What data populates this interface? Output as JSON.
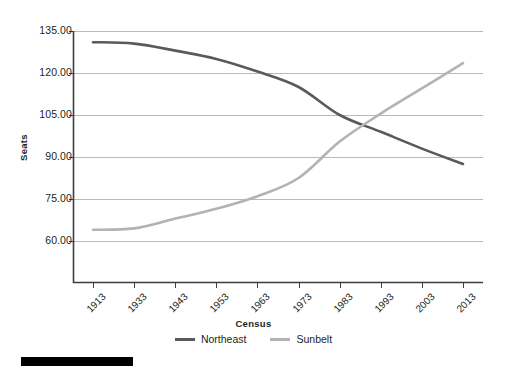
{
  "chart_data": {
    "type": "line",
    "title": "",
    "xlabel": "Census",
    "ylabel": "Seats",
    "grid": true,
    "legend_position": "bottom",
    "categories": [
      "1913",
      "1933",
      "1943",
      "1953",
      "1963",
      "1973",
      "1983",
      "1993",
      "2003",
      "2013"
    ],
    "ylim": [
      45.0,
      135.0
    ],
    "yticks": [
      "60.00",
      "75.00",
      "90.00",
      "105.00",
      "120.00",
      "135.00"
    ],
    "ytick_values": [
      60,
      75,
      90,
      105,
      120,
      135
    ],
    "series": [
      {
        "name": "Northeast",
        "color": "#5a5a5a",
        "values": [
          131.0,
          130.5,
          128.0,
          125.0,
          120.5,
          115.0,
          105.0,
          99.0,
          93.0,
          87.5
        ]
      },
      {
        "name": "Sunbelt",
        "color": "#b3b3b3",
        "values": [
          64.0,
          64.5,
          68.0,
          71.5,
          76.0,
          82.5,
          95.5,
          105.5,
          114.5,
          123.5
        ]
      }
    ]
  },
  "axes": {
    "y_title": "Seats",
    "x_title": "Census"
  },
  "legend": {
    "entries": [
      {
        "label": "Northeast",
        "color": "#5a5a5a",
        "swatch": "line-swatch"
      },
      {
        "label": "Sunbelt",
        "color": "#b3b3b3",
        "swatch": "line-swatch"
      }
    ]
  },
  "colors": {
    "northeast": "#5a5a5a",
    "sunbelt": "#b3b3b3",
    "gridline": "#b9b9b9",
    "axis": "#3d3d3d",
    "text": "#231f20",
    "background": "#ffffff",
    "bottom_bar": "#000000"
  }
}
